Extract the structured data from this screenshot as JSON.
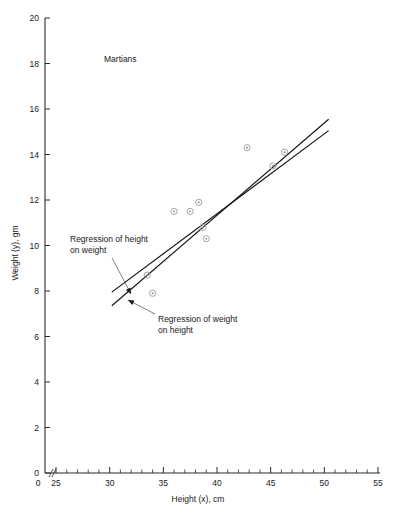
{
  "chart_data": {
    "type": "scatter",
    "title": "Martians",
    "xlabel": "Height (x), cm",
    "ylabel": "Weight (y), gm",
    "xlim": [
      25,
      55
    ],
    "ylim": [
      0,
      20
    ],
    "x_major_ticks": [
      25,
      30,
      35,
      40,
      45,
      50,
      55
    ],
    "x_tick_labels": [
      "25",
      "30",
      "35",
      "40",
      "45",
      "50",
      "55"
    ],
    "x_minor_step": 1,
    "y_major_ticks": [
      0,
      2,
      4,
      6,
      8,
      10,
      12,
      14,
      16,
      18,
      20
    ],
    "y_tick_labels": [
      "0",
      "2",
      "4",
      "6",
      "8",
      "10",
      "12",
      "14",
      "16",
      "18",
      "20"
    ],
    "x_axis_break": true,
    "x_axis_break_label": "0",
    "grid": false,
    "legend": "none",
    "marker_style": "open-circle-with-center-dot",
    "points": [
      {
        "x": 33.5,
        "y": 8.7
      },
      {
        "x": 34.0,
        "y": 7.9
      },
      {
        "x": 36.0,
        "y": 11.5
      },
      {
        "x": 37.5,
        "y": 11.5
      },
      {
        "x": 38.3,
        "y": 11.9
      },
      {
        "x": 38.7,
        "y": 10.8
      },
      {
        "x": 39.0,
        "y": 10.3
      },
      {
        "x": 42.8,
        "y": 14.3
      },
      {
        "x": 45.2,
        "y": 13.5
      },
      {
        "x": 46.3,
        "y": 14.1
      }
    ],
    "series": [
      {
        "name": "Regression of height on weight",
        "type": "line",
        "x": [
          30.2,
          50.4
        ],
        "y": [
          7.35,
          15.55
        ]
      },
      {
        "name": "Regression of weight on height",
        "type": "line",
        "x": [
          30.2,
          50.4
        ],
        "y": [
          7.95,
          15.05
        ]
      }
    ],
    "annotations": [
      {
        "id": "annot-height-on-weight",
        "text_line1": "Regression of height",
        "text_line2": "on weight",
        "text_x": 70,
        "text_y": 242,
        "arrow_from_x": 112,
        "arrow_from_y": 258,
        "arrow_to_x": 131,
        "arrow_to_y": 294
      },
      {
        "id": "annot-weight-on-height",
        "text_line1": "Regression of weight",
        "text_line2": "on height",
        "text_x": 158,
        "text_y": 322,
        "arrow_from_x": 155,
        "arrow_from_y": 314,
        "arrow_to_x": 128,
        "arrow_to_y": 300
      }
    ]
  }
}
